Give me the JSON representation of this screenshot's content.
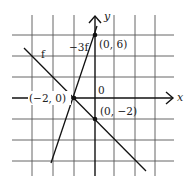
{
  "diagram": {
    "type": "coordinate-plane-graph",
    "grid": {
      "unit_per_cell": 2,
      "x_range_cells": [
        -4,
        4
      ],
      "y_range_cells": [
        -3,
        3
      ]
    },
    "axes": {
      "x_label": "x",
      "y_label": "y",
      "origin_label": "0"
    },
    "lines": [
      {
        "name": "f",
        "label": "f",
        "through": [
          [
            -2,
            0
          ],
          [
            0,
            -2
          ]
        ]
      },
      {
        "name": "-3f",
        "label": "−3f",
        "through": [
          [
            -2,
            0
          ],
          [
            0,
            6
          ]
        ]
      }
    ],
    "points": [
      {
        "label": "(−2, 0)",
        "coords": [
          -2,
          0
        ]
      },
      {
        "label": "(0, 6)",
        "coords": [
          0,
          6
        ]
      },
      {
        "label": "(0, −2)",
        "coords": [
          0,
          -2
        ]
      }
    ]
  }
}
